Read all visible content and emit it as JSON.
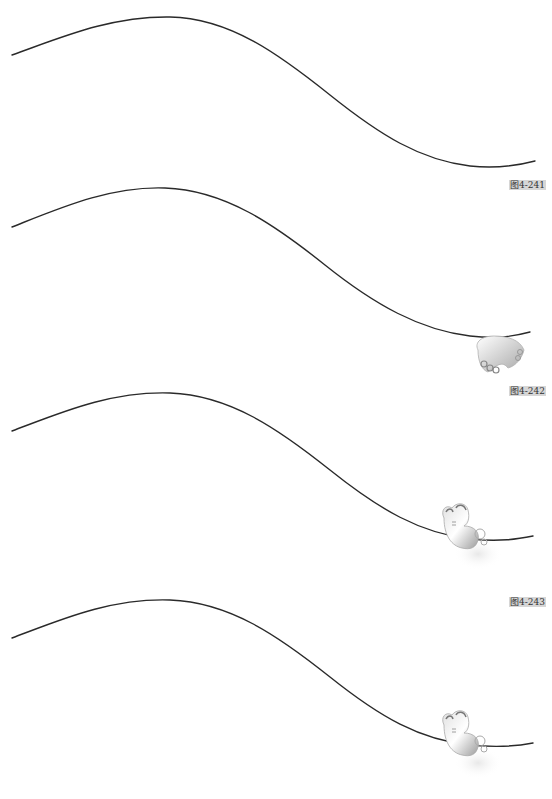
{
  "figures": [
    {
      "caption": "图4-241",
      "butterfly": "none"
    },
    {
      "caption": "图4-242",
      "butterfly": "wings-folded-on-line"
    },
    {
      "caption": "图4-243",
      "butterfly": "perched-on-line"
    },
    {
      "caption": "",
      "butterfly": "perched-on-line"
    }
  ],
  "colors": {
    "line": "#2a2a2a",
    "caption_bg": "#d6d6d6",
    "caption_text": "#333333",
    "butterfly_light": "#f4f4f4",
    "butterfly_dark": "#9a9a9a"
  }
}
